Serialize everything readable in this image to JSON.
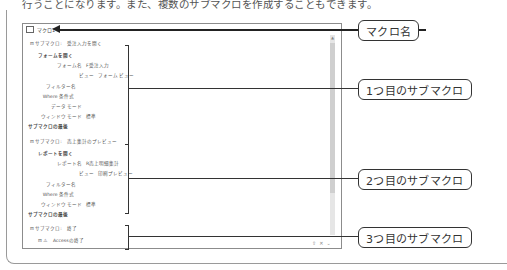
{
  "page": {
    "body_text": "行うことになります。また、複数のサブマクロを作成することもできます。"
  },
  "macro_panel": {
    "title": "マクロ1",
    "submacros": [
      {
        "header_label": "サブマクロ:",
        "header_name": "受注入力を開く",
        "action": "フォームを開く",
        "args": [
          {
            "label": "フォーム名",
            "value": "F受注入力"
          },
          {
            "label": "ビュー",
            "value": "フォーム ビュー"
          },
          {
            "label": "フィルター名",
            "value": ""
          },
          {
            "label": "Where 条件式",
            "value": ""
          },
          {
            "label": "データ モード",
            "value": ""
          },
          {
            "label": "ウィンドウ モード",
            "value": "標準"
          }
        ],
        "end": "サブマクロの最後"
      },
      {
        "header_label": "サブマクロ:",
        "header_name": "売上集計のプレビュー",
        "action": "レポートを開く",
        "args": [
          {
            "label": "レポート名",
            "value": "R売上明細集計"
          },
          {
            "label": "ビュー",
            "value": "印刷プレビュー"
          },
          {
            "label": "フィルター名",
            "value": ""
          },
          {
            "label": "Where 条件式",
            "value": ""
          },
          {
            "label": "ウィンドウ モード",
            "value": "標準"
          }
        ],
        "end": "サブマクロの最後"
      },
      {
        "header_label": "サブマクロ:",
        "header_name": "終了",
        "action": "Accessの終了"
      }
    ],
    "bottom_icons": [
      "move-up",
      "delete",
      "move-down"
    ]
  },
  "callouts": {
    "macro_name": "マクロ名",
    "submacro1": "1つ目のサブマクロ",
    "submacro2": "2つ目のサブマクロ",
    "submacro3": "3つ目のサブマクロ"
  }
}
